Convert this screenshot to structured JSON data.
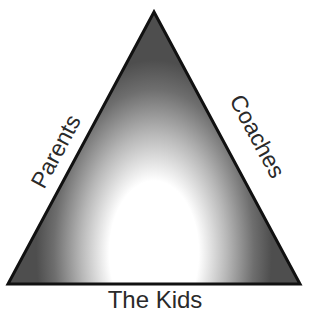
{
  "diagram": {
    "type": "triangle",
    "labels": {
      "left": "Parents",
      "right": "Coaches",
      "bottom": "The Kids"
    },
    "colors": {
      "outline": "#111111",
      "edge_shade": "#5a5a5a",
      "center": "#ffffff",
      "text": "#2a2a2a"
    }
  }
}
